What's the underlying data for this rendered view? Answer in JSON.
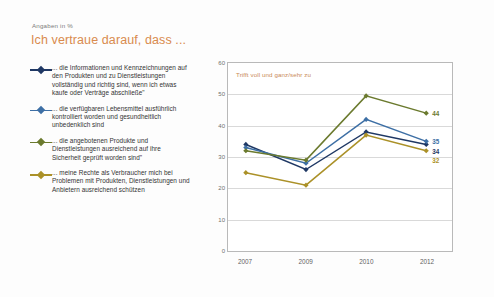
{
  "header": {
    "note": "Angaben in %",
    "title": "Ich vertraue darauf, dass ..."
  },
  "annotation": "Trifft voll und ganz/sehr zu",
  "colors": {
    "navy": "#1f3864",
    "steelblue": "#3d6fa5",
    "olive": "#6b7a2e",
    "gold": "#ab9128",
    "title": "#d98b4e",
    "annotation": "#c98a57",
    "grid": "#d9d9d9",
    "frame": "#b9b9b9"
  },
  "chart_data": {
    "type": "line",
    "title": "Ich vertraue darauf, dass ...",
    "subtitle": "Angaben in %",
    "xlabel": "",
    "ylabel": "",
    "categories": [
      "2007",
      "2009",
      "2010",
      "2012"
    ],
    "x": [
      2007,
      2009,
      2010,
      2012
    ],
    "ylim": [
      0,
      60
    ],
    "yticks": [
      0,
      10,
      20,
      30,
      40,
      50,
      60
    ],
    "grid": true,
    "legend_position": "left",
    "annotations": [
      "Trifft voll und ganz/sehr zu"
    ],
    "series": [
      {
        "name": "... die Informationen und Kennzeichnungen auf den Produkten und zu Dienstleistungen vollständig und richtig sind, wenn ich etwas kaufe oder Verträge abschließe\"",
        "color": "#1f3864",
        "values": [
          34,
          26,
          38,
          34
        ],
        "end_label": "34"
      },
      {
        "name": "... die verfügbaren Lebensmittel ausführlich kontrolliert worden und gesundheitlich unbedenklich sind",
        "color": "#3d6fa5",
        "values": [
          33,
          28,
          42,
          35
        ],
        "end_label": "35"
      },
      {
        "name": "... die angebotenen Produkte und Dienstleistungen ausreichend auf ihre Sicherheit geprüft worden sind\"",
        "color": "#6b7a2e",
        "values": [
          32,
          29,
          49.5,
          44
        ],
        "end_label": "44"
      },
      {
        "name": "... meine Rechte als Verbraucher mich bei Problemen mit Produkten, Dienstleistungen und Anbietern ausreichend schützen",
        "color": "#ab9128",
        "values": [
          25,
          21,
          37,
          32
        ],
        "end_label": "32"
      }
    ]
  },
  "legend": {
    "items": [
      {
        "label": "... die Informationen und Kennzeichnungen auf den Produkten und zu Dienstleistungen vollständig und richtig sind, wenn ich etwas kaufe oder Verträge abschließe\"",
        "color": "#1f3864"
      },
      {
        "label": "... die verfügbaren Lebensmittel ausführlich kontrolliert worden und gesundheitlich unbedenklich sind",
        "color": "#3d6fa5"
      },
      {
        "label": "... die angebotenen Produkte und Dienstleistungen ausreichend auf ihre Sicherheit geprüft worden sind\"",
        "color": "#6b7a2e"
      },
      {
        "label": "... meine Rechte als Verbraucher mich bei Problemen mit Produkten, Dienstleistungen und Anbietern ausreichend schützen",
        "color": "#ab9128"
      }
    ]
  }
}
